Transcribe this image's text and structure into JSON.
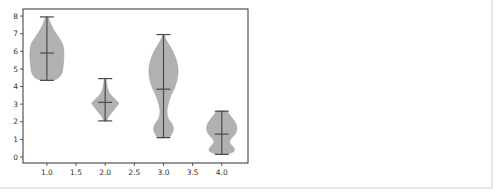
{
  "chart_data": {
    "type": "violin",
    "title": "",
    "xlabel": "",
    "ylabel": "",
    "xlim": [
      0.59,
      4.45
    ],
    "ylim": [
      -0.34,
      8.4
    ],
    "grid": false,
    "legend": "none",
    "xticks": [
      "1.0",
      "1.5",
      "2.0",
      "2.5",
      "3.0",
      "3.5",
      "4.0"
    ],
    "xtick_values": [
      1.0,
      1.5,
      2.0,
      2.5,
      3.0,
      3.5,
      4.0
    ],
    "yticks": [
      "0",
      "1",
      "2",
      "3",
      "4",
      "5",
      "6",
      "7",
      "8"
    ],
    "ytick_values": [
      0,
      1,
      2,
      3,
      4,
      5,
      6,
      7,
      8
    ],
    "colors": {
      "body": "#a9a9a9",
      "lines": "#4a4a4a",
      "axes": "#333333"
    },
    "series": [
      {
        "name": "violin-1",
        "position": 1.0,
        "min": 4.35,
        "center": 5.9,
        "max": 7.95,
        "profile": [
          [
            4.35,
            0.08
          ],
          [
            4.5,
            0.2
          ],
          [
            4.8,
            0.26
          ],
          [
            5.2,
            0.28
          ],
          [
            5.6,
            0.29
          ],
          [
            6.0,
            0.29
          ],
          [
            6.4,
            0.27
          ],
          [
            6.8,
            0.2
          ],
          [
            7.2,
            0.12
          ],
          [
            7.6,
            0.06
          ],
          [
            7.95,
            0.02
          ]
        ]
      },
      {
        "name": "violin-2",
        "position": 2.0,
        "min": 2.05,
        "center": 3.1,
        "max": 4.45,
        "profile": [
          [
            2.05,
            0.02
          ],
          [
            2.3,
            0.06
          ],
          [
            2.6,
            0.13
          ],
          [
            2.9,
            0.2
          ],
          [
            3.05,
            0.23
          ],
          [
            3.25,
            0.18
          ],
          [
            3.5,
            0.1
          ],
          [
            3.8,
            0.05
          ],
          [
            4.1,
            0.03
          ],
          [
            4.45,
            0.01
          ]
        ]
      },
      {
        "name": "violin-3",
        "position": 3.0,
        "min": 1.1,
        "center": 3.85,
        "max": 6.95,
        "profile": [
          [
            1.1,
            0.08
          ],
          [
            1.3,
            0.14
          ],
          [
            1.6,
            0.17
          ],
          [
            1.9,
            0.14
          ],
          [
            2.2,
            0.08
          ],
          [
            2.6,
            0.06
          ],
          [
            3.0,
            0.08
          ],
          [
            3.5,
            0.13
          ],
          [
            4.0,
            0.2
          ],
          [
            4.5,
            0.24
          ],
          [
            5.0,
            0.25
          ],
          [
            5.5,
            0.22
          ],
          [
            6.0,
            0.16
          ],
          [
            6.4,
            0.09
          ],
          [
            6.7,
            0.04
          ],
          [
            6.95,
            0.01
          ]
        ]
      },
      {
        "name": "violin-4",
        "position": 4.0,
        "min": 0.15,
        "center": 1.3,
        "max": 2.6,
        "profile": [
          [
            0.15,
            0.06
          ],
          [
            0.3,
            0.2
          ],
          [
            0.5,
            0.21
          ],
          [
            0.8,
            0.14
          ],
          [
            1.0,
            0.15
          ],
          [
            1.3,
            0.23
          ],
          [
            1.6,
            0.26
          ],
          [
            1.9,
            0.24
          ],
          [
            2.2,
            0.18
          ],
          [
            2.45,
            0.12
          ],
          [
            2.6,
            0.08
          ]
        ]
      }
    ]
  }
}
